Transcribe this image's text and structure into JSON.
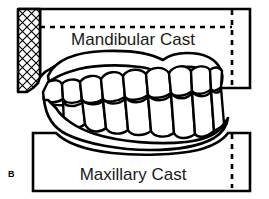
{
  "figure": {
    "panel_label": "B",
    "caption_upper": "Mandibular Cast",
    "caption_lower": "Maxillary Cast",
    "stroke_color": "#000000",
    "fill_color": "#ffffff",
    "background_color": "#ffffff",
    "elements": {
      "upper_cast_base_name": "mandibular-cast-base",
      "lower_cast_base_name": "maxillary-cast-base",
      "hatch_block_name": "cross-hatched-mounting-block",
      "upper_dashed_reference": "horizontal-dashed-reference-line",
      "upper_dashed_vertical": "vertical-dashed-reference-line-upper",
      "lower_dashed_vertical": "vertical-dashed-reference-line-lower",
      "upper_arch_name": "mandibular-dental-arch",
      "lower_arch_name": "maxillary-dental-arch",
      "teeth_upper_row": "mandibular-teeth-row",
      "teeth_lower_row": "maxillary-teeth-row"
    }
  }
}
